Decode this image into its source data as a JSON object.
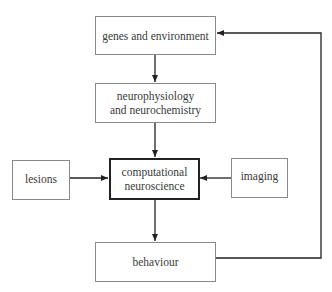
{
  "diagram": {
    "nodes": [
      {
        "id": "genes",
        "lines": [
          "genes and environment"
        ]
      },
      {
        "id": "neuro",
        "lines": [
          "neurophysiology",
          "and neurochemistry"
        ]
      },
      {
        "id": "lesions",
        "lines": [
          "lesions"
        ]
      },
      {
        "id": "comp",
        "lines": [
          "computational",
          "neuroscience"
        ]
      },
      {
        "id": "imaging",
        "lines": [
          "imaging"
        ]
      },
      {
        "id": "behaviour",
        "lines": [
          "behaviour"
        ]
      }
    ],
    "edges": [
      {
        "from": "genes and environment",
        "to": "neurophysiology and neurochemistry"
      },
      {
        "from": "neurophysiology and neurochemistry",
        "to": "computational neuroscience"
      },
      {
        "from": "lesions",
        "to": "computational neuroscience"
      },
      {
        "from": "imaging",
        "to": "computational neuroscience"
      },
      {
        "from": "computational neuroscience",
        "to": "behaviour"
      },
      {
        "from": "behaviour",
        "to": "genes and environment"
      }
    ],
    "colors": {
      "line": "#222222",
      "box_border": "#8a8a8a",
      "main_border": "#222222"
    }
  }
}
